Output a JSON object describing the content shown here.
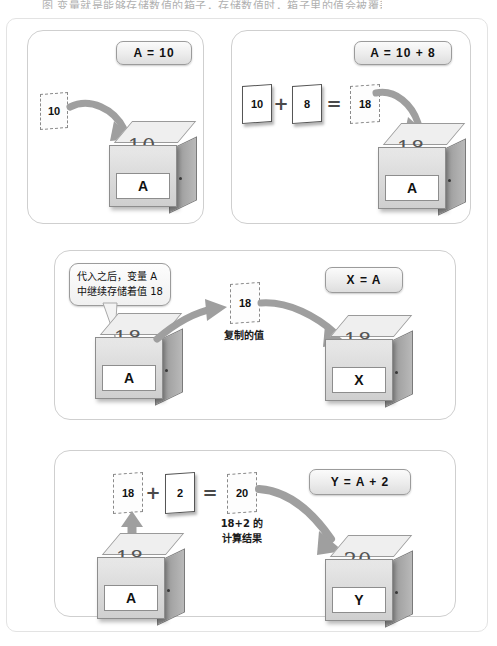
{
  "top_caption": "图 变量就是能够存储数值的箱子，存储数值时，箱子里的值会被覆盖",
  "panels": [
    {
      "id": "panel-assign",
      "badge": "A = 10",
      "cards": [
        {
          "value": "10",
          "style": "dashed"
        }
      ],
      "box": {
        "inner_value": "10",
        "label": "A"
      }
    },
    {
      "id": "panel-add",
      "badge": "A = 10 + 8",
      "cards": [
        {
          "value": "10",
          "style": "solid"
        },
        {
          "value": "8",
          "style": "solid"
        },
        {
          "value": "18",
          "style": "dashed"
        }
      ],
      "operators": [
        "+",
        "="
      ],
      "box": {
        "inner_value": "18",
        "label": "A"
      }
    },
    {
      "id": "panel-copy",
      "badge": "X = A",
      "callout": {
        "line1": "代入之后，变量 A",
        "line2": "中继续存储着值 18"
      },
      "source_box": {
        "inner_value": "18",
        "label": "A"
      },
      "card": {
        "value": "18",
        "style": "dashed"
      },
      "card_caption": "复制的值",
      "target_box": {
        "inner_value": "18",
        "label": "X"
      }
    },
    {
      "id": "panel-compute",
      "badge": "Y = A + 2",
      "cards": [
        {
          "value": "18",
          "style": "dashed"
        },
        {
          "value": "2",
          "style": "solid"
        },
        {
          "value": "20",
          "style": "dashed"
        }
      ],
      "operators": [
        "+",
        "="
      ],
      "result_caption": {
        "line1": "18+2 的",
        "line2": "计算结果"
      },
      "source_box": {
        "inner_value": "18",
        "label": "A"
      },
      "target_box": {
        "inner_value": "20",
        "label": "Y"
      }
    }
  ],
  "colors": {
    "panel_border": "#cfcfcf",
    "badge_border": "#9b9b9b",
    "arrow": "#9a9a9a",
    "box_side": "#a8a8a8",
    "ink": "#111111"
  }
}
